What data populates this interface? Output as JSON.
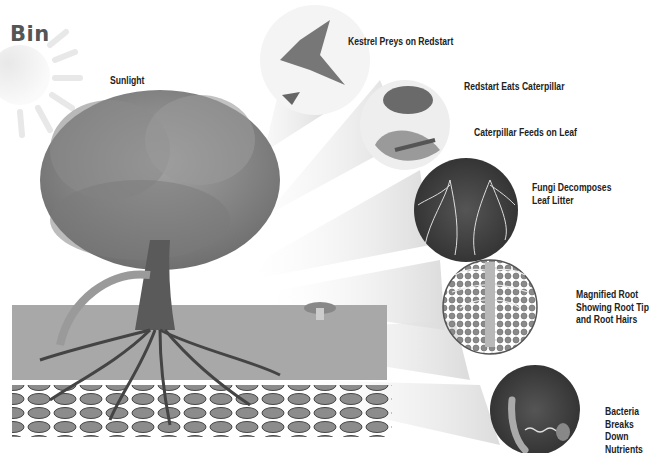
{
  "title": "Bin",
  "labels": {
    "sunlight": "Sunlight",
    "kestrel": "Kestrel Preys on Redstart",
    "redstart": "Redstart Eats Caterpillar",
    "caterpillar": "Caterpillar Feeds on Leaf",
    "fungi": [
      "Fungi Decomposes",
      "Leaf Litter"
    ],
    "root": [
      "Magnified Root",
      "Showing Root Tip",
      "and Root Hairs"
    ],
    "bacteria": [
      "Bacteria",
      "Breaks",
      "Down",
      "Nutrients"
    ]
  },
  "colors": {
    "title": "#555555",
    "label": "#222222",
    "foliage": "#8a8a8a",
    "soil": "#9a9a9a",
    "rocks": "#6e6e6e",
    "beam": "#e6e6e6"
  }
}
